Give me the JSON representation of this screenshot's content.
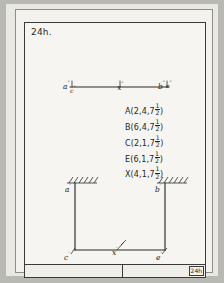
{
  "sheet": {
    "problem_title": "24h.",
    "title_block_number": "24h"
  },
  "plan_view": {
    "labels": [
      {
        "id": "a-double-prime",
        "base": "a",
        "prime": "″"
      },
      {
        "id": "c-double-prime",
        "base": "c",
        "prime": "″"
      },
      {
        "id": "x-double-prime",
        "base": "x",
        "prime": "″"
      },
      {
        "id": "b-double-prime",
        "base": "b",
        "prime": "″"
      },
      {
        "id": "e-double-prime",
        "base": "e",
        "prime": "″"
      }
    ]
  },
  "front_view": {
    "labels": [
      {
        "id": "a-prime",
        "base": "a",
        "prime": "′"
      },
      {
        "id": "b-prime",
        "base": "b",
        "prime": "′"
      },
      {
        "id": "c-prime",
        "base": "c",
        "prime": "′"
      },
      {
        "id": "x-prime",
        "base": "x",
        "prime": "′"
      },
      {
        "id": "e-prime",
        "base": "e",
        "prime": "′"
      }
    ]
  },
  "coordinates": [
    {
      "point": "A",
      "x": "2",
      "y": "4",
      "z_whole": "7",
      "z_num": "1",
      "z_den": "2"
    },
    {
      "point": "B",
      "x": "6",
      "y": "4",
      "z_whole": "7",
      "z_num": "1",
      "z_den": "2"
    },
    {
      "point": "C",
      "x": "2",
      "y": "1",
      "z_whole": "7",
      "z_num": "1",
      "z_den": "2"
    },
    {
      "point": "E",
      "x": "6",
      "y": "1",
      "z_whole": "7",
      "z_num": "1",
      "z_den": "2"
    },
    {
      "point": "X",
      "x": "4",
      "y": "1",
      "z_whole": "7",
      "z_num": "1",
      "z_den": "2"
    }
  ],
  "colors": {
    "page_background": "#b9b9b4",
    "paper": "#f3f2ee",
    "ink": "#272725",
    "border": "#3a3a38"
  }
}
